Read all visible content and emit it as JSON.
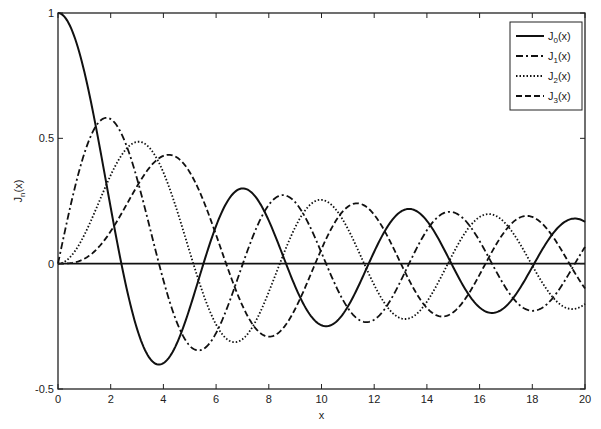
{
  "chart_data": {
    "type": "line",
    "title": "",
    "xlabel": "x",
    "ylabel": "J_n(x)",
    "xlim": [
      0,
      20
    ],
    "ylim": [
      -0.5,
      1
    ],
    "grid": false,
    "legend_position": "top-right",
    "xticks": [
      0,
      2,
      4,
      6,
      8,
      10,
      12,
      14,
      16,
      18,
      20
    ],
    "xtick_labels": [
      "0",
      "2",
      "4",
      "6",
      "8",
      "10",
      "12",
      "14",
      "16",
      "18",
      "20"
    ],
    "yticks": [
      -0.5,
      0,
      0.5,
      1
    ],
    "ytick_labels": [
      "-0.5",
      "0",
      "0.5",
      "1"
    ],
    "x": [
      0,
      1,
      2,
      3,
      4,
      5,
      6,
      7,
      8,
      9,
      10,
      11,
      12,
      13,
      14,
      15,
      16,
      17,
      18,
      19,
      20
    ],
    "series": [
      {
        "name": "J0(x)",
        "order": 0,
        "style": "solid",
        "values": [
          1.0,
          0.765,
          0.224,
          -0.26,
          -0.397,
          -0.178,
          0.151,
          0.3,
          0.172,
          -0.09,
          -0.246,
          -0.171,
          0.048,
          0.207,
          0.171,
          -0.014,
          -0.175,
          -0.17,
          -0.013,
          0.147,
          0.167
        ]
      },
      {
        "name": "J1(x)",
        "order": 1,
        "style": "dashdot",
        "values": [
          0.0,
          0.44,
          0.577,
          0.339,
          -0.066,
          -0.328,
          -0.277,
          -0.005,
          0.235,
          0.245,
          0.043,
          -0.177,
          -0.223,
          -0.07,
          0.133,
          0.205,
          0.09,
          -0.098,
          -0.188,
          -0.106,
          0.067
        ]
      },
      {
        "name": "J2(x)",
        "order": 2,
        "style": "dotted",
        "values": [
          0.0,
          0.115,
          0.353,
          0.486,
          0.364,
          0.047,
          -0.243,
          -0.301,
          -0.113,
          0.145,
          0.255,
          0.139,
          -0.085,
          -0.218,
          -0.152,
          0.042,
          0.186,
          0.158,
          -0.008,
          -0.158,
          -0.16
        ]
      },
      {
        "name": "J3(x)",
        "order": 3,
        "style": "dashed",
        "values": [
          0.0,
          0.02,
          0.129,
          0.309,
          0.43,
          0.365,
          0.115,
          -0.168,
          -0.291,
          -0.181,
          0.058,
          0.227,
          0.195,
          -0.003,
          -0.177,
          -0.194,
          -0.044,
          0.135,
          0.186,
          0.072,
          -0.099
        ]
      }
    ],
    "legend": [
      {
        "main": "J",
        "sub": "0",
        "suffix": "(x)"
      },
      {
        "main": "J",
        "sub": "1",
        "suffix": "(x)"
      },
      {
        "main": "J",
        "sub": "2",
        "suffix": "(x)"
      },
      {
        "main": "J",
        "sub": "3",
        "suffix": "(x)"
      }
    ],
    "ylabel_parts": {
      "main": "J",
      "sub": "n",
      "suffix": "(x)"
    },
    "line_color": "#111111"
  }
}
